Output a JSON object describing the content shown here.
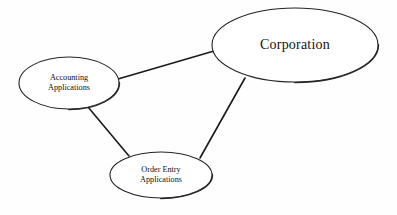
{
  "diagram": {
    "type": "node-link-diagram",
    "background_color": "#fefefe",
    "stroke_color": "#242424",
    "node_fill_color": "#ffffff",
    "nodes": [
      {
        "id": "corporation",
        "label": "Corporation",
        "lines": [
          "Corporation"
        ],
        "center_x": 295,
        "center_y": 45,
        "radius_x": 83,
        "radius_y": 37,
        "text_size": "large"
      },
      {
        "id": "accounting-applications",
        "label": "Accounting Applications",
        "lines": [
          "Accounting",
          "Applications"
        ],
        "center_x": 69,
        "center_y": 83,
        "radius_x": 50,
        "radius_y": 26,
        "text_size": "small"
      },
      {
        "id": "order-entry-applications",
        "label": "Order Entry Applications",
        "lines": [
          "Order Entry",
          "Applications"
        ],
        "center_x": 161,
        "center_y": 175,
        "radius_x": 51,
        "radius_y": 23,
        "text_size": "small"
      }
    ],
    "edges": [
      {
        "id": "accounting-to-corporation",
        "from": "accounting-applications",
        "to": "corporation",
        "x1": 118,
        "y1": 79,
        "x2": 214,
        "y2": 51
      },
      {
        "id": "accounting-to-order-entry",
        "from": "accounting-applications",
        "to": "order-entry-applications",
        "x1": 88,
        "y1": 107,
        "x2": 129,
        "y2": 156
      },
      {
        "id": "corporation-to-order-entry",
        "from": "corporation",
        "to": "order-entry-applications",
        "x1": 245,
        "y1": 78,
        "x2": 200,
        "y2": 158
      }
    ]
  }
}
